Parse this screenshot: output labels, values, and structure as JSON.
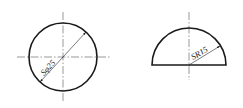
{
  "figures": [
    {
      "name": "sphere",
      "shape": "circle",
      "dimension_label": "Sφ25",
      "colors": {
        "outline": "#1a1a1a",
        "centerline": "#555555"
      }
    },
    {
      "name": "hemisphere",
      "shape": "semicircle",
      "dimension_label": "SR15",
      "colors": {
        "outline": "#1a1a1a",
        "centerline": "#555555"
      }
    }
  ]
}
